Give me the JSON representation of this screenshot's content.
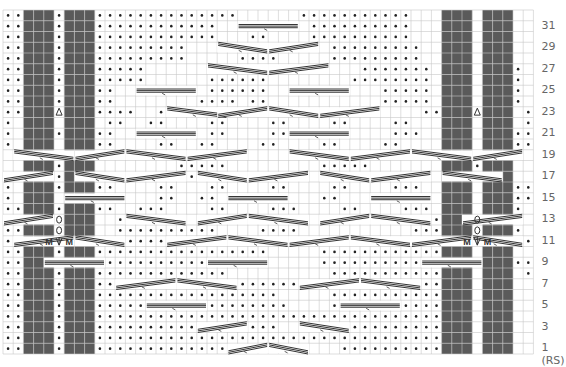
{
  "chart": {
    "columns": 52,
    "rows": 32,
    "origin": [
      3,
      10
    ],
    "cell_w": 10.2,
    "cell_h": 10.75,
    "colors": {
      "grid": "#c8c8c8",
      "dark": "#5a5a5a",
      "dot": "#222222",
      "cable": "#333333",
      "label": "#666666"
    },
    "row_labels": [
      "31",
      "29",
      "27",
      "25",
      "23",
      "21",
      "19",
      "17",
      "15",
      "13",
      "11",
      "9",
      "7",
      "5",
      "3",
      "1 (RS)"
    ],
    "legend_symbols": {
      "dot": "purl",
      "blank": "knit",
      "dark": "no stitch",
      "M": "make one",
      "arrow-down": "central double decrease",
      "arrow-up": "increase",
      "cable": "cable cross"
    },
    "grid_rows": [
      "pp...p...pppppppppppppp......ppppppppppp...p...pp",
      "pp...p...pppppppppppp.........pppppppppp...p...pp",
      "pp...p...pppppppppppp...pp....pppppppppp...p...pp",
      "pp...p...ppppppppp.......pp.....ppppppppp...p...pp",
      "pp...p...ppppppppp.....pppp.....ppppppppp...p...pp",
      "pp...p...ppppp........pppp.........ppppppp...p...pp",
      "pp...p...ppppp......pppppp........pppppppp...p...pp",
      "pp...p...pp.........pppppp...........ppppp...p...pp",
      "pp...p...pp........pppp.pp...........ppppp...p...pp",
      "pp...p...pppp..ppppppp....ppppppppppp....ppp...p...pp",
      "p.........pp..pp....pp....pp....pp....pp....pp.....p",
      "p....pp..pp....pp...pp....pp....pp....ppp....p....pp",
      "p.....p..pp....pp..pp....pp....pp....pp....pp.....pp",
      "...ppppp.........ppppp.........ppppp.........ppppp..",
      "...ppppp.........ppppp.........ppppp.........ppppp..",
      "...ppppp.........ppppp.........ppppp.........ppppp..",
      "p....pp..pp....pp...pp....pp....pp....ppp....p....pp",
      "p.....p..pp....pp..pp....pp....pp....pp....pp.....pp",
      "pp...p...pp..ppp....pp....ppp....pp....ppp...p...pp",
      "pp..d.p.d..pppppp........pppp...........pppppp.d.p.d.pp",
      "pp.dd.p.dd.pppppppppp....pppp...........pppppp.dd.p.dd.pp",
      "pp...p...ppppppppppppp.........pppppppppppp...p...pp",
      "pp...p...ppppppppppppppppp.....pppppppppppppp...p...pp",
      "pp...p...ppppppppppppp.........pppppppppppp...p...pp",
      "pp...p...ppppppppppppp..........pppppppppppp...p...pp",
      "pp...p...pppppppppppppppppppp..pppppppppppppp...p...pp",
      "pp...p...pppppppppppppppppp.....ppppppppppppp...p...pp",
      "pp...p...ppppppppppppppppppp....pppppppppppppp...p...pp",
      "pp...p...ppppppppppppppppppppppppppppppppppppp...p...pp",
      "pp...p...pppppppppppppppppp.....ppppppppppppp...p...pp",
      "pp...p...ppppppppppppppppppppppppppppppppppppp...p...pp",
      "pp...p...pppppppppppppppppp......pppppppppppp...p...pp"
    ],
    "dark_blocks": [
      {
        "rows": [
          0,
          22
        ],
        "cols": [
          2,
          3,
          4,
          6,
          7,
          8,
          43,
          44,
          45,
          47,
          48,
          49
        ]
      },
      {
        "rows": [
          20,
          20
        ],
        "cols": [
          2,
          8,
          43,
          49
        ]
      },
      {
        "rows": [
          21,
          21
        ],
        "cols": [
          2,
          3,
          7,
          8,
          43,
          44,
          48,
          49
        ]
      },
      {
        "rows": [
          22,
          31
        ],
        "cols": [
          2,
          3,
          4,
          6,
          7,
          8,
          43,
          44,
          45,
          47,
          48,
          49
        ]
      }
    ],
    "marks": [
      {
        "row": 9,
        "col": 5,
        "sym": "arrow-up"
      },
      {
        "row": 9,
        "col": 46,
        "sym": "arrow-up"
      },
      {
        "row": 19,
        "col": 5,
        "sym": "twist"
      },
      {
        "row": 20,
        "col": 5,
        "sym": "twist"
      },
      {
        "row": 19,
        "col": 46,
        "sym": "twist"
      },
      {
        "row": 20,
        "col": 46,
        "sym": "twist"
      },
      {
        "row": 21,
        "col": 4,
        "sym": "M"
      },
      {
        "row": 21,
        "col": 5,
        "sym": "arrow-down"
      },
      {
        "row": 21,
        "col": 6,
        "sym": "M"
      },
      {
        "row": 21,
        "col": 45,
        "sym": "M"
      },
      {
        "row": 21,
        "col": 46,
        "sym": "arrow-down"
      },
      {
        "row": 21,
        "col": 47,
        "sym": "M"
      }
    ],
    "cables": [
      {
        "row": 1,
        "c0": 22,
        "c1": 26,
        "dir": "up"
      },
      {
        "row": 1,
        "c0": 26,
        "c1": 30,
        "dir": "down"
      },
      {
        "row": 3,
        "c0": 19,
        "c1": 24,
        "dir": "up"
      },
      {
        "row": 3,
        "c0": 29,
        "c1": 34,
        "dir": "down"
      },
      {
        "row": 5,
        "c0": 14,
        "c1": 20,
        "dir": "flat"
      },
      {
        "row": 5,
        "c0": 33,
        "c1": 39,
        "dir": "flat"
      },
      {
        "row": 7,
        "c0": 11,
        "c1": 17,
        "dir": "up"
      },
      {
        "row": 7,
        "c0": 17,
        "c1": 23,
        "dir": "down"
      },
      {
        "row": 7,
        "c0": 29,
        "c1": 35,
        "dir": "up"
      },
      {
        "row": 7,
        "c0": 35,
        "c1": 41,
        "dir": "down"
      },
      {
        "row": 9,
        "c0": 4,
        "c1": 10,
        "dir": "flat"
      },
      {
        "row": 9,
        "c0": 20,
        "c1": 26,
        "dir": "flat"
      },
      {
        "row": 9,
        "c0": 41,
        "c1": 47,
        "dir": "flat"
      },
      {
        "row": 11,
        "c0": 1,
        "c1": 7,
        "dir": "up"
      },
      {
        "row": 11,
        "c0": 7,
        "c1": 12,
        "dir": "down"
      },
      {
        "row": 11,
        "c0": 16,
        "c1": 22,
        "dir": "up"
      },
      {
        "row": 11,
        "c0": 22,
        "c1": 28,
        "dir": "down"
      },
      {
        "row": 11,
        "c0": 28,
        "c1": 34,
        "dir": "up"
      },
      {
        "row": 11,
        "c0": 34,
        "c1": 40,
        "dir": "down"
      },
      {
        "row": 11,
        "c0": 40,
        "c1": 46,
        "dir": "up"
      },
      {
        "row": 11,
        "c0": 46,
        "c1": 51,
        "dir": "down"
      },
      {
        "row": 13,
        "c0": 0,
        "c1": 5,
        "dir": "up"
      },
      {
        "row": 13,
        "c0": 12,
        "c1": 18,
        "dir": "down"
      },
      {
        "row": 13,
        "c0": 19,
        "c1": 24,
        "dir": "up"
      },
      {
        "row": 13,
        "c0": 24,
        "c1": 30,
        "dir": "down"
      },
      {
        "row": 13,
        "c0": 31,
        "c1": 36,
        "dir": "up"
      },
      {
        "row": 13,
        "c0": 36,
        "c1": 42,
        "dir": "down"
      },
      {
        "row": 13,
        "c0": 45,
        "c1": 51,
        "dir": "up"
      },
      {
        "row": 15,
        "c0": 6,
        "c1": 12,
        "dir": "flat"
      },
      {
        "row": 15,
        "c0": 22,
        "c1": 28,
        "dir": "flat"
      },
      {
        "row": 15,
        "c0": 36,
        "c1": 42,
        "dir": "flat"
      },
      {
        "row": 17,
        "c0": 0,
        "c1": 5,
        "dir": "up"
      },
      {
        "row": 17,
        "c0": 7,
        "c1": 12,
        "dir": "down"
      },
      {
        "row": 17,
        "c0": 12,
        "c1": 18,
        "dir": "up"
      },
      {
        "row": 17,
        "c0": 19,
        "c1": 24,
        "dir": "down"
      },
      {
        "row": 17,
        "c0": 24,
        "c1": 30,
        "dir": "up"
      },
      {
        "row": 17,
        "c0": 31,
        "c1": 36,
        "dir": "down"
      },
      {
        "row": 17,
        "c0": 36,
        "c1": 42,
        "dir": "up"
      },
      {
        "row": 17,
        "c0": 43,
        "c1": 49,
        "dir": "down"
      },
      {
        "row": 19,
        "c0": 1,
        "c1": 7,
        "dir": "down"
      },
      {
        "row": 19,
        "c0": 7,
        "c1": 12,
        "dir": "up"
      },
      {
        "row": 19,
        "c0": 12,
        "c1": 18,
        "dir": "down"
      },
      {
        "row": 19,
        "c0": 18,
        "c1": 24,
        "dir": "up"
      },
      {
        "row": 19,
        "c0": 28,
        "c1": 34,
        "dir": "down"
      },
      {
        "row": 19,
        "c0": 34,
        "c1": 40,
        "dir": "up"
      },
      {
        "row": 19,
        "c0": 40,
        "c1": 46,
        "dir": "down"
      },
      {
        "row": 19,
        "c0": 46,
        "c1": 51,
        "dir": "up"
      },
      {
        "row": 21,
        "c0": 13,
        "c1": 19,
        "dir": "flat"
      },
      {
        "row": 21,
        "c0": 28,
        "c1": 34,
        "dir": "flat"
      },
      {
        "row": 23,
        "c0": 16,
        "c1": 22,
        "dir": "down"
      },
      {
        "row": 23,
        "c0": 21,
        "c1": 26,
        "dir": "up"
      },
      {
        "row": 23,
        "c0": 26,
        "c1": 31,
        "dir": "down"
      },
      {
        "row": 23,
        "c0": 31,
        "c1": 37,
        "dir": "up"
      },
      {
        "row": 25,
        "c0": 13,
        "c1": 19,
        "dir": "flat"
      },
      {
        "row": 25,
        "c0": 28,
        "c1": 34,
        "dir": "flat"
      },
      {
        "row": 27,
        "c0": 20,
        "c1": 26,
        "dir": "down"
      },
      {
        "row": 27,
        "c0": 26,
        "c1": 32,
        "dir": "up"
      },
      {
        "row": 29,
        "c0": 21,
        "c1": 26,
        "dir": "down"
      },
      {
        "row": 29,
        "c0": 26,
        "c1": 31,
        "dir": "up"
      },
      {
        "row": 31,
        "c0": 23,
        "c1": 29,
        "dir": "flat"
      }
    ]
  }
}
